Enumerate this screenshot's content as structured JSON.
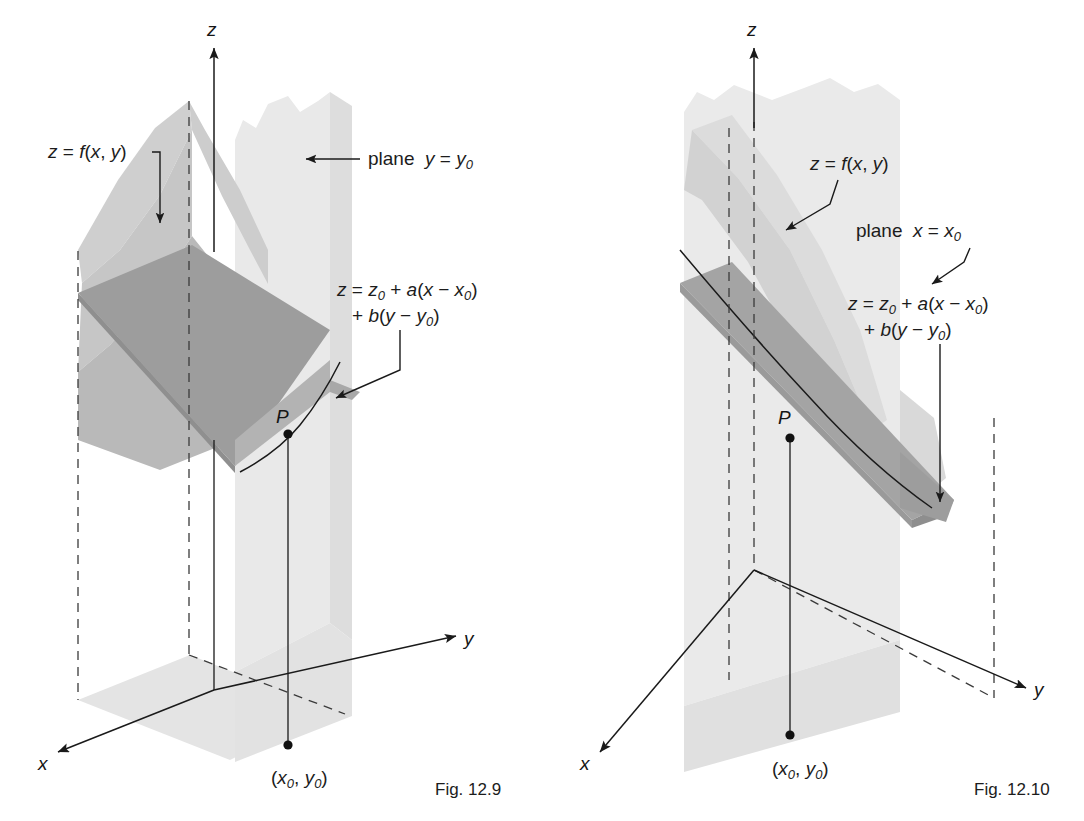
{
  "page": {
    "background_color": "#ffffff",
    "width": 1084,
    "height": 821
  },
  "palette": {
    "ink": "#1a1a1a",
    "dashed_line": "#3a3a3a",
    "plane_section_light": "#e8e8e8",
    "plane_section_mid": "#dcdcdc",
    "surface_light": "#cfcfcf",
    "surface_mid": "#bcbcbc",
    "tangent_plane_dark": "#9a9a9a",
    "tangent_plane_mid": "#ababab",
    "floor_shadow": "#e2e2e2"
  },
  "figures": [
    {
      "id": "fig-12-9",
      "caption": "Fig. 12.9",
      "axes": {
        "x_label": "x",
        "y_label": "y",
        "z_label": "z"
      },
      "point_label": "P",
      "foot_point_label_parts": {
        "open": "(",
        "x": "x",
        "xsub": "0",
        "comma": ", ",
        "y": "y",
        "ysub": "0",
        "close": ")"
      },
      "foot_point_label": "(x0, y0)",
      "annotations": [
        {
          "name": "surface-label",
          "text_parts": {
            "lhs": "z",
            "eq": " = ",
            "fn": "f",
            "args": "(x, y)"
          },
          "text": "z = f(x, y)",
          "leader": "elbow-down-arrow"
        },
        {
          "name": "plane-label",
          "text_parts": {
            "word": "plane ",
            "var": "y",
            "eq": " = ",
            "rhs": "y",
            "rhs_sub": "0"
          },
          "text": "plane  y = y0",
          "leader": "horizontal-left-arrow"
        },
        {
          "name": "tangent-plane-equation",
          "line1_parts": {
            "z": "z",
            "eq": " = ",
            "z0": "z",
            "z0sub": "0",
            "plus": " + ",
            "a": "a",
            "open": "(",
            "x": "x",
            "minus": " − ",
            "x0": "x",
            "x0sub": "0",
            "close": ")"
          },
          "line2_parts": {
            "plus": "+ ",
            "b": "b",
            "open": "(",
            "y": "y",
            "minus": " − ",
            "y0": "y",
            "y0sub": "0",
            "close": ")"
          },
          "line1": "z = z0 + a(x − x0)",
          "line2": "+ b(y − y0)",
          "leader": "bent-down-left-arrow"
        }
      ]
    },
    {
      "id": "fig-12-10",
      "caption": "Fig. 12.10",
      "axes": {
        "x_label": "x",
        "y_label": "y",
        "z_label": "z"
      },
      "point_label": "P",
      "foot_point_label_parts": {
        "open": "(",
        "x": "x",
        "xsub": "0",
        "comma": ", ",
        "y": "y",
        "ysub": "0",
        "close": ")"
      },
      "foot_point_label": "(x0, y0)",
      "annotations": [
        {
          "name": "surface-label",
          "text_parts": {
            "lhs": "z",
            "eq": " = ",
            "fn": "f",
            "args": "(x, y)"
          },
          "text": "z = f(x, y)",
          "leader": "bent-down-left-arrow"
        },
        {
          "name": "plane-label",
          "text_parts": {
            "word": "plane ",
            "var": "x",
            "eq": " = ",
            "rhs": "x",
            "rhs_sub": "0"
          },
          "text": "plane  x = x0",
          "leader": "bent-down-left-arrow"
        },
        {
          "name": "tangent-plane-equation",
          "line1_parts": {
            "z": "z",
            "eq": " = ",
            "z0": "z",
            "z0sub": "0",
            "plus": " + ",
            "a": "a",
            "open": "(",
            "x": "x",
            "minus": " − ",
            "x0": "x",
            "x0sub": "0",
            "close": ")"
          },
          "line2_parts": {
            "plus": "+ ",
            "b": "b",
            "open": "(",
            "y": "y",
            "minus": " − ",
            "y0": "y",
            "y0sub": "0",
            "close": ")"
          },
          "line1": "z = z0 + a(x − x0)",
          "line2": "+ b(y − y0)",
          "leader": "long-vertical-down-arrow"
        }
      ]
    }
  ]
}
